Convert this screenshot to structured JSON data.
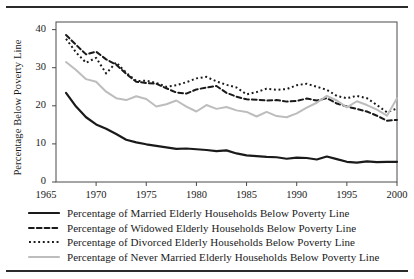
{
  "chart_data": {
    "type": "line",
    "title": "",
    "xlabel": "",
    "ylabel": "Percentage Below Poverty Line",
    "xlim": [
      1966,
      2000
    ],
    "ylim": [
      0,
      42
    ],
    "xticks": [
      1965,
      1970,
      1975,
      1980,
      1985,
      1990,
      1995,
      2000
    ],
    "yticks": [
      0,
      10,
      20,
      30,
      40
    ],
    "grid": false,
    "legend_position": "below",
    "x": [
      1967,
      1968,
      1969,
      1970,
      1971,
      1972,
      1973,
      1974,
      1975,
      1976,
      1977,
      1978,
      1979,
      1980,
      1981,
      1982,
      1983,
      1984,
      1985,
      1986,
      1987,
      1988,
      1989,
      1990,
      1991,
      1992,
      1993,
      1994,
      1995,
      1996,
      1997,
      1998,
      1999,
      2000
    ],
    "series": [
      {
        "name": "Percentage of Married Elderly Households Below Poverty Line",
        "style": "solid",
        "color": "#1a1a1a",
        "width": 2.2,
        "values": [
          23.4,
          19.8,
          17.0,
          15.1,
          14.0,
          12.6,
          11.1,
          10.4,
          9.9,
          9.5,
          9.1,
          8.7,
          8.8,
          8.6,
          8.4,
          8.1,
          8.3,
          7.5,
          7.0,
          6.8,
          6.6,
          6.5,
          6.1,
          6.4,
          6.3,
          5.9,
          6.7,
          6.0,
          5.3,
          5.1,
          5.4,
          5.2,
          5.3,
          5.3
        ]
      },
      {
        "name": "Percentage of Widowed Elderly Households Below Poverty Line",
        "style": "dashed",
        "color": "#1a1a1a",
        "width": 2.0,
        "values": [
          38.6,
          36.0,
          33.5,
          34.2,
          32.2,
          30.8,
          28.4,
          26.3,
          26.0,
          25.8,
          24.6,
          23.5,
          23.2,
          24.3,
          24.8,
          25.2,
          23.4,
          22.4,
          21.7,
          21.6,
          21.4,
          21.5,
          21.1,
          21.3,
          21.9,
          21.4,
          22.0,
          20.6,
          19.8,
          19.2,
          18.5,
          17.4,
          16.1,
          16.3
        ]
      },
      {
        "name": "Percentage of Divorced Elderly Households Below Poverty Line",
        "style": "dotted",
        "color": "#1a1a1a",
        "width": 2.0,
        "values": [
          37.6,
          34.0,
          31.3,
          32.6,
          28.5,
          31.4,
          28.7,
          26.5,
          26.6,
          26.0,
          25.0,
          25.4,
          26.2,
          27.2,
          27.6,
          26.4,
          25.5,
          24.8,
          23.0,
          23.6,
          24.5,
          24.2,
          24.4,
          25.4,
          25.8,
          25.0,
          24.2,
          22.6,
          22.0,
          22.6,
          22.0,
          20.2,
          18.3,
          19.3
        ]
      },
      {
        "name": "Percentage of Never Married Elderly Households Below Poverty Line",
        "style": "solid",
        "color": "#bdbdbd",
        "width": 2.0,
        "values": [
          31.5,
          29.4,
          27.0,
          26.3,
          23.7,
          22.0,
          21.5,
          22.5,
          21.8,
          19.8,
          20.4,
          21.4,
          19.8,
          18.5,
          20.2,
          19.2,
          19.7,
          18.8,
          18.4,
          17.2,
          18.4,
          17.3,
          17.0,
          18.0,
          19.5,
          20.8,
          22.6,
          21.4,
          19.6,
          21.2,
          20.2,
          19.0,
          17.4,
          22.0
        ]
      }
    ]
  }
}
